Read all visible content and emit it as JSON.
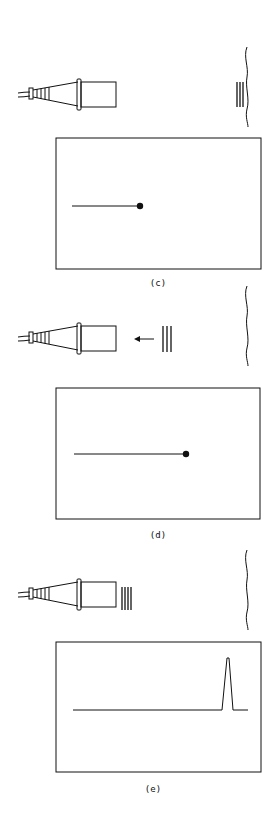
{
  "figure": {
    "panels": [
      {
        "id": "c",
        "label": "(c)",
        "pulse_position": "at-reflector",
        "pulse_lines": 3,
        "display": "trace-with-dot",
        "trace_end_fraction": 0.35
      },
      {
        "id": "d",
        "label": "(d)",
        "pulse_position": "returning-toward-transducer",
        "pulse_lines": 3,
        "arrow": "left",
        "display": "trace-with-dot",
        "trace_end_fraction": 0.62
      },
      {
        "id": "e",
        "label": "(e)",
        "pulse_position": "at-transducer",
        "pulse_lines": 4,
        "display": "baseline-with-echo-spike",
        "spike_position_fraction": 0.85
      }
    ],
    "colors": {
      "ink": "#111111",
      "background": "#ffffff"
    }
  }
}
